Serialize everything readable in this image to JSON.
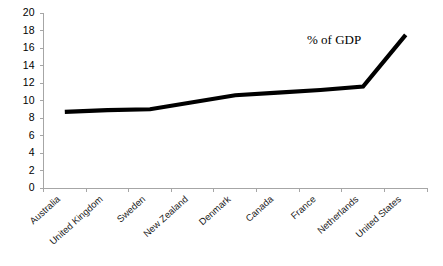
{
  "chart_data": {
    "type": "line",
    "title": "",
    "subtitle": "",
    "xlabel": "",
    "ylabel": "",
    "categories": [
      "Australia",
      "United Kingdom",
      "Sweden",
      "New Zealand",
      "Denmark",
      "Canada",
      "France",
      "Netherlands",
      "United States"
    ],
    "values": [
      8.7,
      8.9,
      9.0,
      9.8,
      10.6,
      10.9,
      11.2,
      11.6,
      17.5
    ],
    "series": [
      {
        "name": "% of GDP",
        "values": [
          8.7,
          8.9,
          9.0,
          9.8,
          10.6,
          10.9,
          11.2,
          11.6,
          17.5
        ],
        "color": "#000000"
      }
    ],
    "annotations": [
      {
        "text": "% of GDP",
        "x_category": "France",
        "y_value": 17.5
      }
    ],
    "ylim": [
      0,
      20
    ],
    "yticks": [
      0,
      2,
      4,
      6,
      8,
      10,
      12,
      14,
      16,
      18,
      20
    ],
    "ytick_labels": [
      "0",
      "2",
      "4",
      "6",
      "8",
      "10",
      "12",
      "14",
      "16",
      "18",
      "20"
    ],
    "grid": false,
    "legend": false,
    "legend_position": "none",
    "axis_color": "#a6a6a6",
    "line_color": "#000000",
    "background_color": "#ffffff"
  }
}
